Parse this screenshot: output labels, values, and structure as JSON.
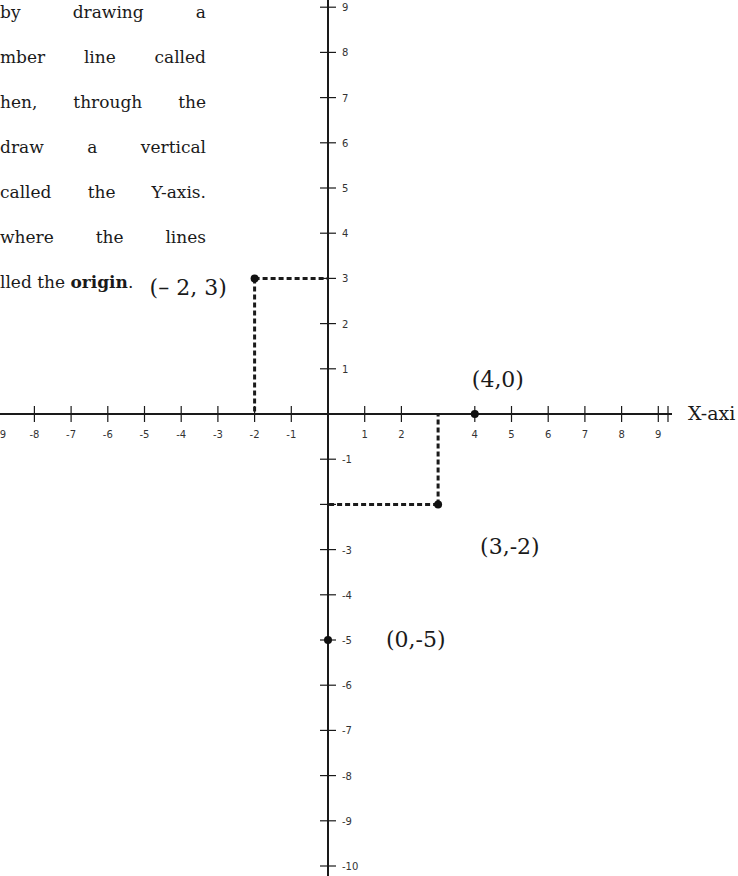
{
  "text": {
    "lines": [
      [
        "by",
        "drawing",
        "a"
      ],
      [
        "mber",
        "line",
        "called"
      ],
      [
        "hen,",
        "through",
        "the"
      ],
      [
        "draw",
        "a",
        "vertical"
      ],
      [
        "called",
        "the",
        "Y-axis."
      ],
      [
        "where",
        "the",
        "lines"
      ]
    ],
    "last_line_prefix": "lled the ",
    "last_line_bold": "origin",
    "last_line_suffix": "."
  },
  "chart_data": {
    "type": "scatter",
    "title": "",
    "xlabel": "X-axi",
    "ylabel": "",
    "x_ticks": [
      -9,
      -8,
      -7,
      -6,
      -5,
      -4,
      -3,
      -2,
      -1,
      1,
      2,
      4,
      5,
      6,
      7,
      8,
      9
    ],
    "x_tick_labels": [
      "9",
      "-8",
      "-7",
      "-6",
      "-5",
      "-4",
      "-3",
      "-2",
      "-1",
      "1",
      "2",
      "4",
      "5",
      "6",
      "7",
      "8",
      "9"
    ],
    "y_ticks": [
      9,
      8,
      7,
      6,
      5,
      4,
      3,
      2,
      1,
      -1,
      -3,
      -4,
      -5,
      -6,
      -7,
      -8,
      -9,
      -10
    ],
    "y_tick_labels": [
      "9",
      "8",
      "7",
      "6",
      "5",
      "4",
      "3",
      "2",
      "1",
      "-1",
      "-3",
      "-4",
      "-5",
      "-6",
      "-7",
      "-8",
      "-9",
      "-10"
    ],
    "xlim": [
      -9,
      9
    ],
    "ylim": [
      -10,
      9
    ],
    "grid": false,
    "points": [
      {
        "x": -2,
        "y": 3,
        "label": "(– 2, 3)",
        "dashed_guides": true
      },
      {
        "x": 4,
        "y": 0,
        "label": "(4,0)",
        "dashed_guides": false
      },
      {
        "x": 3,
        "y": -2,
        "label": "(3,-2)",
        "dashed_guides": true
      },
      {
        "x": 0,
        "y": -5,
        "label": "(0,-5)",
        "dashed_guides": false
      }
    ]
  },
  "layout": {
    "origin_px": [
      328,
      414
    ],
    "x_unit_px": 36.7,
    "y_unit_px": 45.2,
    "x_axis_end_px": 672,
    "label_offsets": [
      [
        -105,
        17
      ],
      [
        -3,
        -27
      ],
      [
        42,
        50
      ],
      [
        58,
        7
      ]
    ],
    "colors": {
      "axis": "#1a1a1a",
      "point": "#111111",
      "text": "#1a1a1a"
    }
  }
}
